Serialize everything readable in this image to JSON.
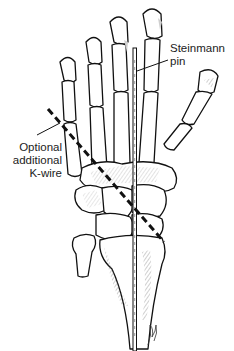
{
  "figure": {
    "labels": {
      "steinmann_pin": [
        "Steinmann",
        "pin"
      ],
      "k_wire": [
        "Optional",
        "additional",
        "K-wire"
      ]
    },
    "colors": {
      "line": "#111111",
      "shading": "#cfcfcf",
      "background": "#ffffff"
    }
  }
}
